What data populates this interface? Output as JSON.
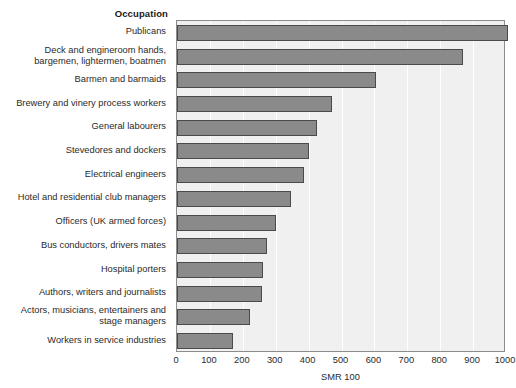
{
  "chart_data": {
    "type": "bar",
    "orientation": "horizontal",
    "title": "",
    "category_axis_title": "Occupation",
    "xlabel": "SMR 100",
    "ylabel": "",
    "xlim": [
      0,
      1000
    ],
    "xticks": [
      0,
      100,
      200,
      300,
      400,
      500,
      600,
      700,
      800,
      900,
      1000
    ],
    "xtick_labels": [
      "0",
      "100",
      "200",
      "300",
      "400",
      "500",
      "600",
      "700",
      "800",
      "900",
      "1000"
    ],
    "grid": "vertical-only",
    "legend": "none",
    "bar_color": "#8a8a8a",
    "bar_edge_color": "#4a4a4a",
    "plot_background": "#f0f0f0",
    "gridline_color": "#ffffff",
    "categories": [
      "Publicans",
      "Deck and engineroom hands,\nbargemen, lightermen, boatmen",
      "Barmen and barmaids",
      "Brewery and vinery process workers",
      "General labourers",
      "Stevedores and dockers",
      "Electrical engineers",
      "Hotel and residential club managers",
      "Officers (UK armed forces)",
      "Bus conductors, drivers  mates",
      "Hospital porters",
      "Authors, writers and journalists",
      "Actors, musicians, entertainers and\nstage managers",
      "Workers in service industries"
    ],
    "values": [
      1005,
      870,
      605,
      470,
      425,
      400,
      385,
      345,
      300,
      275,
      262,
      258,
      222,
      170
    ]
  }
}
